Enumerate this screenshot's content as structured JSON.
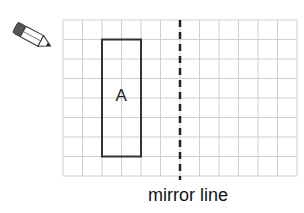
{
  "diagram": {
    "grid": {
      "left": 63,
      "top": 20,
      "cell": 19.5,
      "cols": 12,
      "rows": 8,
      "line_color": "#cfcfcf"
    },
    "shape": {
      "label": "A",
      "col_start": 2,
      "col_end": 4,
      "row_start": 1,
      "row_end": 7,
      "stroke": "#333333"
    },
    "mirror_line": {
      "col": 6,
      "label": "mirror line",
      "color": "#222222"
    },
    "icon": "pencil-icon"
  }
}
